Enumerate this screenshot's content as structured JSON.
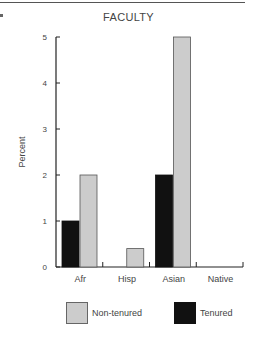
{
  "chart_data": {
    "type": "bar",
    "title": "FACULTY",
    "xlabel": "",
    "ylabel": "Percent",
    "ylim": [
      0,
      5
    ],
    "yticks": [
      0,
      1,
      2,
      3,
      4,
      5
    ],
    "categories": [
      "Afr",
      "Hisp",
      "Asian",
      "Native"
    ],
    "series": [
      {
        "name": "Tenured",
        "color": "#111111",
        "values": [
          1,
          0,
          2,
          0
        ]
      },
      {
        "name": "Non-tenured",
        "color": "#cccccc",
        "values": [
          2,
          0.4,
          5,
          0
        ]
      }
    ],
    "grid": false,
    "legend_position": "bottom"
  },
  "legend": {
    "items": [
      {
        "label": "Non-tenured",
        "color": "#cccccc"
      },
      {
        "label": "Tenured",
        "color": "#111111"
      }
    ]
  }
}
